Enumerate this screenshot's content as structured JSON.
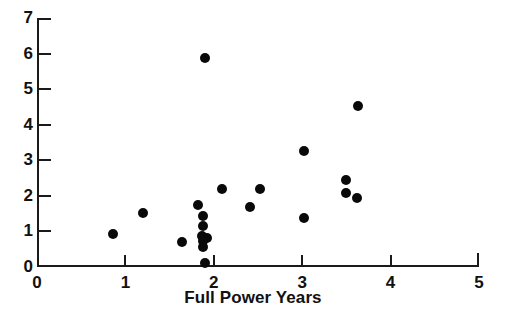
{
  "chart_data": {
    "type": "scatter",
    "title": "",
    "xlabel": "Full Power Years",
    "ylabel": "",
    "xlim": [
      0,
      5
    ],
    "ylim": [
      0,
      7
    ],
    "xticks": [
      0,
      1,
      2,
      3,
      4,
      5
    ],
    "yticks": [
      0,
      1,
      2,
      3,
      4,
      5,
      6,
      7
    ],
    "xticklabels": [
      "0",
      "1",
      "2",
      "3",
      "4",
      "5"
    ],
    "yticklabels": [
      "0",
      "1",
      "2",
      "3",
      "4",
      "5",
      "6",
      "7"
    ],
    "grid": false,
    "legend": null,
    "marker": "filled-circle",
    "marker_color": "#090909",
    "axis_color": "#1a1a1a",
    "background_color": "#ffffff",
    "points": [
      {
        "x": 0.86,
        "y": 0.93
      },
      {
        "x": 1.2,
        "y": 1.52
      },
      {
        "x": 1.64,
        "y": 0.7
      },
      {
        "x": 1.82,
        "y": 1.75
      },
      {
        "x": 1.88,
        "y": 1.42
      },
      {
        "x": 1.88,
        "y": 1.15
      },
      {
        "x": 1.87,
        "y": 0.88
      },
      {
        "x": 1.92,
        "y": 0.82
      },
      {
        "x": 1.88,
        "y": 0.72
      },
      {
        "x": 1.88,
        "y": 0.56
      },
      {
        "x": 1.9,
        "y": 0.1
      },
      {
        "x": 1.9,
        "y": 5.87
      },
      {
        "x": 2.09,
        "y": 2.2
      },
      {
        "x": 2.41,
        "y": 1.68
      },
      {
        "x": 2.52,
        "y": 2.2
      },
      {
        "x": 3.02,
        "y": 3.27
      },
      {
        "x": 3.02,
        "y": 1.38
      },
      {
        "x": 3.5,
        "y": 2.44
      },
      {
        "x": 3.49,
        "y": 2.07
      },
      {
        "x": 3.62,
        "y": 1.95
      },
      {
        "x": 3.63,
        "y": 4.52
      }
    ]
  }
}
